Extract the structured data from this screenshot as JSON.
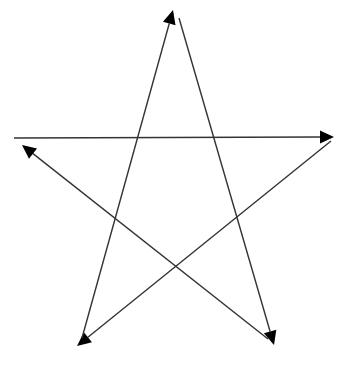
{
  "diagram": {
    "title": "",
    "type": "pentagram-arrows",
    "stroke_color": "#333333",
    "arrow_color": "#000000",
    "background": "#ffffff",
    "segments": [
      {
        "id": "horizontal",
        "from": [
          14,
          138
        ],
        "to": [
          334,
          137
        ],
        "arrow": "right"
      },
      {
        "id": "right-to-bottom-left",
        "from": [
          331,
          141
        ],
        "to": [
          77,
          346
        ],
        "arrow": "bottom-left"
      },
      {
        "id": "bottom-left-to-top",
        "from": [
          82,
          338
        ],
        "to": [
          173,
          10
        ],
        "arrow": "top"
      },
      {
        "id": "top-to-bottom-right",
        "from": [
          179,
          18
        ],
        "to": [
          274,
          345
        ],
        "arrow": "bottom-right"
      },
      {
        "id": "bottom-right-to-left",
        "from": [
          268,
          339
        ],
        "to": [
          22,
          145
        ],
        "arrow": "top-left"
      }
    ]
  }
}
